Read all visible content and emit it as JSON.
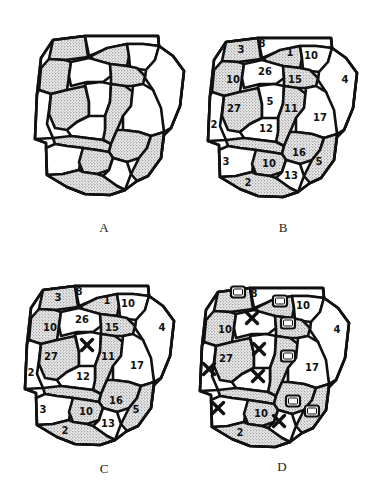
{
  "figure": {
    "panels": [
      {
        "id": "A",
        "label": "A",
        "description": "Unlabeled patch map with stippled and white regions",
        "show_numbers": false,
        "offset": [
          -173,
          -2
        ],
        "label_pos": [
          104,
          220
        ]
      },
      {
        "id": "B",
        "label": "B",
        "description": "Patch map with region numbers",
        "show_numbers": true,
        "offset": [
          0,
          0
        ],
        "label_pos": [
          283,
          220
        ]
      },
      {
        "id": "C",
        "label": "C",
        "description": "Patch map with region numbers; central region 5 marked with X",
        "show_numbers": true,
        "hide_numbers": [
          "5"
        ],
        "offset": [
          -183,
          248
        ],
        "label_pos": [
          104,
          461
        ],
        "x_marks": [
          [
            87,
            345
          ]
        ]
      },
      {
        "id": "D",
        "label": "D",
        "description": "Patch map with partial region numbers; X marks and square markers indicating removed/selected regions",
        "show_numbers": true,
        "visible_numbers": [
          "8",
          "10a",
          "27",
          "10c",
          "17",
          "4",
          "10b",
          "2b"
        ],
        "offset": [
          -8,
          250
        ],
        "label_pos": [
          282,
          459
        ],
        "x_marks": [
          [
            252,
            318
          ],
          [
            259,
            349
          ],
          [
            258,
            376
          ],
          [
            209,
            369
          ],
          [
            218,
            408
          ],
          [
            279,
            421
          ]
        ],
        "square_marks": [
          [
            238,
            292
          ],
          [
            280,
            301
          ],
          [
            288,
            323
          ],
          [
            288,
            356
          ],
          [
            293,
            401
          ],
          [
            312,
            411
          ]
        ]
      }
    ],
    "region_numbers": [
      {
        "key": "3a",
        "text": "3",
        "x": 241,
        "y": 49
      },
      {
        "key": "8",
        "text": "8",
        "x": 262,
        "y": 43
      },
      {
        "key": "1",
        "text": "1",
        "x": 290,
        "y": 52
      },
      {
        "key": "10a",
        "text": "10",
        "x": 311,
        "y": 55
      },
      {
        "key": "26",
        "text": "26",
        "x": 265,
        "y": 71
      },
      {
        "key": "10b",
        "text": "10",
        "x": 233,
        "y": 79
      },
      {
        "key": "15",
        "text": "15",
        "x": 295,
        "y": 79
      },
      {
        "key": "4",
        "text": "4",
        "x": 345,
        "y": 79
      },
      {
        "key": "5",
        "text": "5",
        "x": 270,
        "y": 101
      },
      {
        "key": "27",
        "text": "27",
        "x": 234,
        "y": 108
      },
      {
        "key": "11",
        "text": "11",
        "x": 291,
        "y": 108
      },
      {
        "key": "17",
        "text": "17",
        "x": 320,
        "y": 117
      },
      {
        "key": "2a",
        "text": "2",
        "x": 214,
        "y": 124
      },
      {
        "key": "12",
        "text": "12",
        "x": 266,
        "y": 128
      },
      {
        "key": "16",
        "text": "16",
        "x": 299,
        "y": 152
      },
      {
        "key": "3b",
        "text": "3",
        "x": 226,
        "y": 161
      },
      {
        "key": "10c",
        "text": "10",
        "x": 269,
        "y": 163
      },
      {
        "key": "5b",
        "text": "5",
        "x": 319,
        "y": 161
      },
      {
        "key": "13",
        "text": "13",
        "x": 291,
        "y": 175
      },
      {
        "key": "2b",
        "text": "2",
        "x": 248,
        "y": 182
      }
    ],
    "colors": {
      "ink": "#111111",
      "stipple_dot": "#555555",
      "background": "#ffffff"
    }
  }
}
